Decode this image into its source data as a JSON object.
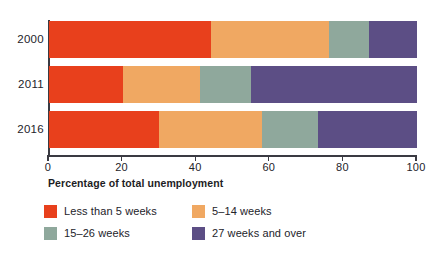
{
  "chart_data": {
    "type": "bar",
    "orientation": "horizontal",
    "stacked": true,
    "normalized": true,
    "title": "",
    "subtitle": "",
    "xlabel": "Percentage of total unemployment",
    "ylabel": "",
    "categories": [
      "2000",
      "2011",
      "2016"
    ],
    "xlim": [
      0,
      100
    ],
    "xticks": [
      0,
      20,
      40,
      60,
      80,
      100
    ],
    "xtick_labels": [
      "0",
      "20",
      "40",
      "60",
      "80",
      "100"
    ],
    "grid": false,
    "legend_position": "bottom-left",
    "series": [
      {
        "name": "Less than 5 weeks",
        "color": "#E8401C",
        "values": [
          44,
          20,
          30
        ]
      },
      {
        "name": "5–14 weeks",
        "color": "#F0A862",
        "values": [
          32,
          21,
          28
        ]
      },
      {
        "name": "15–26 weeks",
        "color": "#8FA89C",
        "values": [
          11,
          14,
          15
        ]
      },
      {
        "name": "27 weeks and over",
        "color": "#5C4E85",
        "values": [
          13,
          45,
          27
        ]
      }
    ]
  },
  "axis": {
    "x_title": "Percentage of total unemployment",
    "tick_labels": [
      "0",
      "20",
      "40",
      "60",
      "80",
      "100"
    ]
  },
  "rows": {
    "r0_label": "2000",
    "r1_label": "2011",
    "r2_label": "2016"
  },
  "legend": {
    "items": [
      {
        "label": "Less than 5 weeks",
        "color": "#E8401C"
      },
      {
        "label": "5–14 weeks",
        "color": "#F0A862"
      },
      {
        "label": "15–26 weeks",
        "color": "#8FA89C"
      },
      {
        "label": "27 weeks and over",
        "color": "#5C4E85"
      }
    ]
  }
}
